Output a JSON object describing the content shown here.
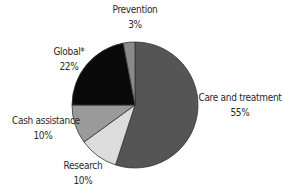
{
  "chart_data": {
    "type": "pie",
    "title": "",
    "start_angle_deg": 0,
    "direction": "clockwise",
    "slices": [
      {
        "label": "Care and treatment",
        "value": 55,
        "display": "55%",
        "color": "#555555"
      },
      {
        "label": "Research",
        "value": 10,
        "display": "10%",
        "color": "#dcdcdc"
      },
      {
        "label": "Cash assistance",
        "value": 10,
        "display": "10%",
        "color": "#9a9a9a"
      },
      {
        "label": "Global*",
        "value": 22,
        "display": "22%",
        "color": "#0a0a0a"
      },
      {
        "label": "Prevention",
        "value": 3,
        "display": "3%",
        "color": "#8a8a8a"
      }
    ],
    "categories": [
      "Care and treatment",
      "Research",
      "Cash assistance",
      "Global*",
      "Prevention"
    ],
    "values": [
      55,
      10,
      10,
      22,
      3
    ],
    "unit": "%",
    "legend": "none (direct labels)"
  },
  "labels": {
    "care": {
      "name": "Care and treatment",
      "pct": "55%"
    },
    "research": {
      "name": "Research",
      "pct": "10%"
    },
    "cash": {
      "name": "Cash assistance",
      "pct": "10%"
    },
    "global": {
      "name": "Global*",
      "pct": "22%"
    },
    "prevention": {
      "name": "Prevention",
      "pct": "3%"
    }
  }
}
